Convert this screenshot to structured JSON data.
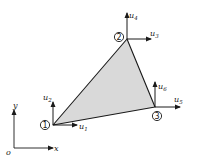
{
  "diagram": {
    "title": "",
    "element": {
      "type": "triangular element",
      "fill_color": "#d9d9d9",
      "edge_color": "#1a1a1a"
    },
    "nodes": [
      {
        "id": "1",
        "label": "1"
      },
      {
        "id": "2",
        "label": "2"
      },
      {
        "id": "3",
        "label": "3"
      }
    ],
    "dofs": [
      {
        "base": "u",
        "sub": "1",
        "node": "1",
        "direction": "x"
      },
      {
        "base": "u",
        "sub": "2",
        "node": "1",
        "direction": "y"
      },
      {
        "base": "u",
        "sub": "3",
        "node": "2",
        "direction": "x"
      },
      {
        "base": "u",
        "sub": "4",
        "node": "2",
        "direction": "y"
      },
      {
        "base": "u",
        "sub": "5",
        "node": "3",
        "direction": "x"
      },
      {
        "base": "u",
        "sub": "6",
        "node": "3",
        "direction": "y"
      }
    ],
    "axes": {
      "origin_label": "o",
      "x_label": "x",
      "y_label": "y"
    }
  }
}
